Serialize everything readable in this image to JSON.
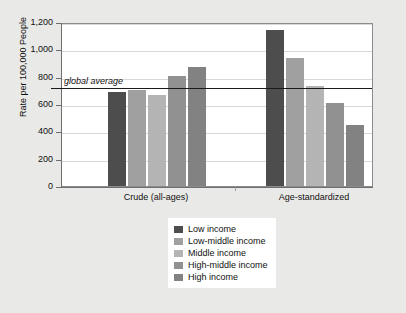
{
  "chart_data": {
    "type": "bar",
    "title": "",
    "subtitle": "",
    "xlabel": "",
    "ylabel": "Rate per 100,000 People",
    "ylim": [
      0,
      1200
    ],
    "ytick_values": [
      1200,
      1000,
      800,
      600,
      400,
      200,
      0
    ],
    "ytick_labels": [
      "1,200",
      "1,000",
      "800",
      "600",
      "400",
      "200",
      "0"
    ],
    "grid": true,
    "legend_position": "bottom-center",
    "categories": [
      "Crude (all-ages)",
      "Age-standardized"
    ],
    "series": [
      {
        "name": "Low income",
        "color": "#4d4d4d",
        "values": [
          690,
          1140
        ]
      },
      {
        "name": "Low-middle income",
        "color": "#a0a0a0",
        "values": [
          700,
          940
        ]
      },
      {
        "name": "Middle income",
        "color": "#b4b4b4",
        "values": [
          665,
          730
        ]
      },
      {
        "name": "High-middle income",
        "color": "#919191",
        "values": [
          805,
          605
        ]
      },
      {
        "name": "High income",
        "color": "#828282",
        "values": [
          870,
          450
        ]
      }
    ],
    "annotations": [
      {
        "name": "global-average",
        "label": "global average",
        "value": 730,
        "style": "italic",
        "line_color": "#1a1a1a"
      }
    ]
  },
  "legend": {
    "items": [
      {
        "label": "Low income"
      },
      {
        "label": "Low-middle income"
      },
      {
        "label": "Middle income"
      },
      {
        "label": "High-middle income"
      },
      {
        "label": "High income"
      }
    ]
  }
}
